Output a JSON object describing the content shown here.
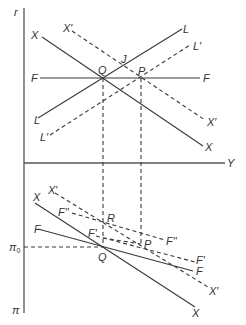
{
  "figure": {
    "type": "two-panel economics diagram",
    "upper_panel": {
      "vertical_axis_label": "r",
      "horizontal_axis_label": "Y",
      "curves": [
        {
          "label": "X",
          "style": "solid",
          "description": "downward sloping"
        },
        {
          "label": "X′",
          "style": "dashed",
          "description": "shifted X curve"
        },
        {
          "label": "L",
          "style": "solid",
          "description": "upward sloping"
        },
        {
          "label": "L′",
          "style": "dashed",
          "description": "shifted L curve"
        },
        {
          "label": "F",
          "style": "solid",
          "description": "horizontal"
        }
      ],
      "points": [
        "Q",
        "P",
        "J"
      ]
    },
    "lower_panel": {
      "vertical_axis_label": "π",
      "reference_level": "π",
      "reference_level_subscript": "0",
      "curves": [
        {
          "label": "X",
          "style": "solid"
        },
        {
          "label": "X′",
          "style": "dashed"
        },
        {
          "label": "F",
          "style": "solid"
        },
        {
          "label": "F′",
          "style": "dashed"
        },
        {
          "label": "F′′",
          "style": "dashed"
        }
      ],
      "points": [
        "Q",
        "R",
        "P"
      ]
    }
  },
  "labels": {
    "r": "r",
    "Y": "Y",
    "pi": "π",
    "pi0_main": "π",
    "pi0_sub": "0",
    "up_X_left": "X",
    "up_X_right": "X",
    "up_Xp_left": "X′",
    "up_Xp_right": "X′",
    "up_L_left": "L",
    "up_L_right": "L",
    "up_Lp_left": "L′",
    "up_Lp_right": "L′",
    "up_F_left": "F",
    "up_F_right": "F",
    "up_Q": "Q",
    "up_P": "P",
    "up_J": "J",
    "lo_X_left": "X",
    "lo_X_right": "X",
    "lo_Xp_left": "X′",
    "lo_Xp_right": "X′",
    "lo_F_left": "F",
    "lo_F_right": "F",
    "lo_Fp_left": "F′",
    "lo_Fp_right": "F′",
    "lo_Fpp_left": "F′′",
    "lo_Fpp_right": "F′′",
    "lo_Q": "Q",
    "lo_R": "R",
    "lo_P": "P"
  }
}
